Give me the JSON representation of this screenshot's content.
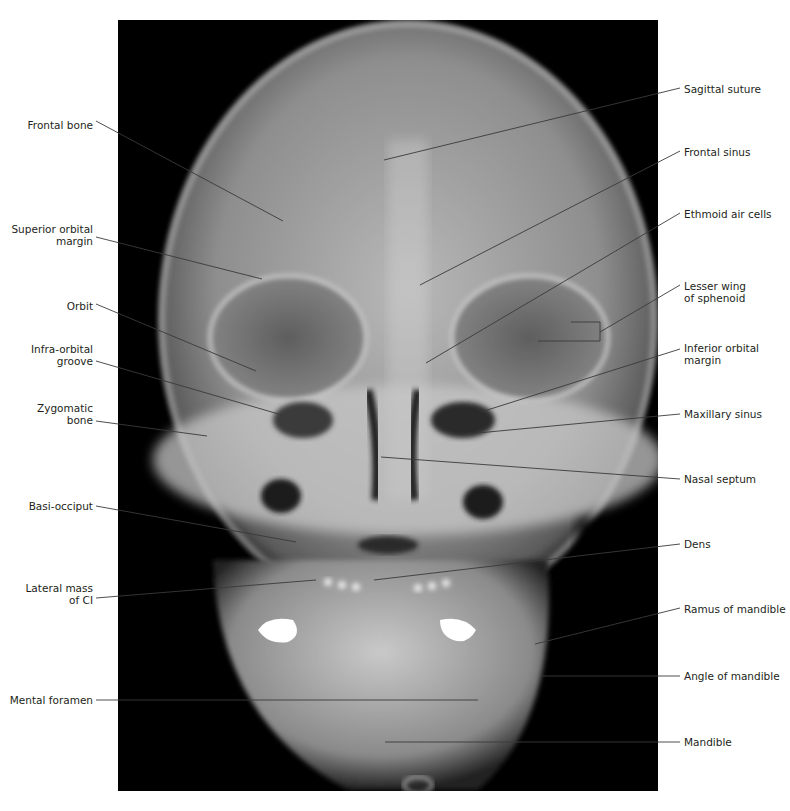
{
  "figure": {
    "image_frame": {
      "x": 118,
      "y": 20,
      "width": 540,
      "height": 771,
      "background": "#000000"
    },
    "line_color": "#3a3a3a",
    "label_color": "#231f20"
  },
  "labels_left": [
    {
      "id": "frontal-bone",
      "lines": [
        "Frontal bone"
      ],
      "text_right_x": 93,
      "text_y": 119,
      "leader": [
        [
          96,
          121
        ],
        [
          283,
          221
        ]
      ]
    },
    {
      "id": "superior-orbital-margin",
      "lines": [
        "Superior orbital",
        "margin"
      ],
      "text_right_x": 93,
      "text_y": 223,
      "leader": [
        [
          96,
          237
        ],
        [
          262,
          279
        ]
      ]
    },
    {
      "id": "orbit",
      "lines": [
        "Orbit"
      ],
      "text_right_x": 93,
      "text_y": 300,
      "leader": [
        [
          96,
          304
        ],
        [
          256,
          371
        ]
      ]
    },
    {
      "id": "infra-orbital-groove",
      "lines": [
        "Infra-orbital",
        "groove"
      ],
      "text_right_x": 93,
      "text_y": 343,
      "leader": [
        [
          96,
          361
        ],
        [
          282,
          415
        ]
      ]
    },
    {
      "id": "zygomatic-bone",
      "lines": [
        "Zygomatic",
        "bone"
      ],
      "text_right_x": 93,
      "text_y": 402,
      "leader": [
        [
          96,
          421
        ],
        [
          207,
          436
        ]
      ]
    },
    {
      "id": "basi-occiput",
      "lines": [
        "Basi-occiput"
      ],
      "text_right_x": 93,
      "text_y": 500,
      "leader": [
        [
          96,
          506
        ],
        [
          296,
          542
        ]
      ]
    },
    {
      "id": "lateral-mass-of-c1",
      "lines": [
        "Lateral mass",
        "of CI"
      ],
      "text_right_x": 93,
      "text_y": 582,
      "leader": [
        [
          96,
          598
        ],
        [
          316,
          580
        ]
      ]
    },
    {
      "id": "mental-foramen",
      "lines": [
        "Mental foramen"
      ],
      "text_right_x": 93,
      "text_y": 694,
      "leader": [
        [
          96,
          700
        ],
        [
          478,
          700
        ]
      ]
    }
  ],
  "labels_right": [
    {
      "id": "sagittal-suture",
      "lines": [
        "Sagittal suture"
      ],
      "text_left_x": 684,
      "text_y": 83,
      "leader": [
        [
          680,
          88
        ],
        [
          384,
          160
        ]
      ]
    },
    {
      "id": "frontal-sinus",
      "lines": [
        "Frontal sinus"
      ],
      "text_left_x": 684,
      "text_y": 146,
      "leader": [
        [
          680,
          151
        ],
        [
          420,
          285
        ]
      ]
    },
    {
      "id": "ethmoid-air-cells",
      "lines": [
        "Ethmoid air cells"
      ],
      "text_left_x": 684,
      "text_y": 208,
      "leader": [
        [
          680,
          213
        ],
        [
          426,
          363
        ]
      ]
    },
    {
      "id": "lesser-wing-of-sphenoid",
      "lines": [
        "Lesser wing",
        "of sphenoid"
      ],
      "text_left_x": 684,
      "text_y": 280,
      "leader": [
        [
          680,
          285
        ],
        [
          600,
          332
        ]
      ],
      "bracket": {
        "x": 600,
        "top": 322,
        "bottom": 341,
        "top_left": 571,
        "bottom_left": 538
      }
    },
    {
      "id": "inferior-orbital-margin",
      "lines": [
        "Inferior orbital",
        "margin"
      ],
      "text_left_x": 684,
      "text_y": 342,
      "leader": [
        [
          680,
          349
        ],
        [
          481,
          412
        ]
      ]
    },
    {
      "id": "maxillary-sinus",
      "lines": [
        "Maxillary sinus"
      ],
      "text_left_x": 684,
      "text_y": 408,
      "leader": [
        [
          680,
          414
        ],
        [
          467,
          434
        ]
      ]
    },
    {
      "id": "nasal-septum",
      "lines": [
        "Nasal septum"
      ],
      "text_left_x": 684,
      "text_y": 473,
      "leader": [
        [
          680,
          479
        ],
        [
          381,
          457
        ]
      ]
    },
    {
      "id": "dens",
      "lines": [
        "Dens"
      ],
      "text_left_x": 684,
      "text_y": 538,
      "leader": [
        [
          680,
          544
        ],
        [
          374,
          580
        ]
      ]
    },
    {
      "id": "ramus-of-mandible",
      "lines": [
        "Ramus of mandible"
      ],
      "text_left_x": 684,
      "text_y": 603,
      "leader": [
        [
          680,
          608
        ],
        [
          535,
          644
        ]
      ]
    },
    {
      "id": "angle-of-mandible",
      "lines": [
        "Angle of mandible"
      ],
      "text_left_x": 684,
      "text_y": 670,
      "leader": [
        [
          680,
          676
        ],
        [
          541,
          676
        ]
      ]
    },
    {
      "id": "mandible",
      "lines": [
        "Mandible"
      ],
      "text_left_x": 684,
      "text_y": 736,
      "leader": [
        [
          680,
          742
        ],
        [
          385,
          742
        ]
      ]
    }
  ]
}
